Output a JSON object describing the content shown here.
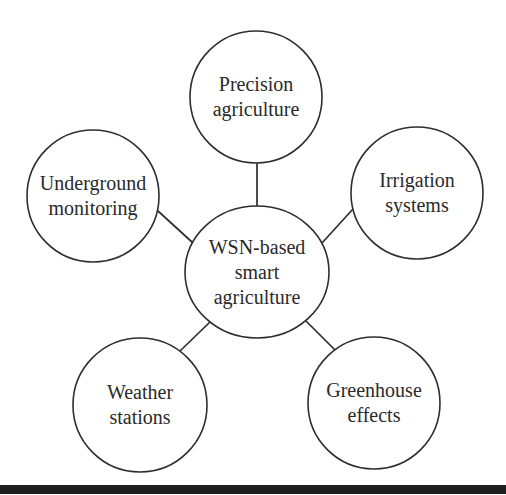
{
  "diagram": {
    "center": {
      "id": "center",
      "lines": [
        "WSN-based",
        "smart",
        "agriculture"
      ],
      "cx": 257,
      "cy": 272,
      "rx": 72,
      "ry": 66
    },
    "nodes": [
      {
        "id": "precision-agriculture",
        "lines": [
          "Precision",
          "agriculture"
        ],
        "cx": 256,
        "cy": 97,
        "r": 66
      },
      {
        "id": "underground-monitoring",
        "lines": [
          "Underground",
          "monitoring"
        ],
        "cx": 93,
        "cy": 196,
        "r": 66
      },
      {
        "id": "irrigation-systems",
        "lines": [
          "Irrigation",
          "systems"
        ],
        "cx": 417,
        "cy": 193,
        "r": 66
      },
      {
        "id": "weather-stations",
        "lines": [
          "Weather",
          "stations"
        ],
        "cx": 140,
        "cy": 405,
        "r": 67
      },
      {
        "id": "greenhouse-effects",
        "lines": [
          "Greenhouse",
          "effects"
        ],
        "cx": 374,
        "cy": 403,
        "r": 66
      }
    ],
    "edges": [
      {
        "from": "center",
        "to": "precision-agriculture",
        "x1": 257,
        "y1": 206,
        "x2": 257,
        "y2": 163
      },
      {
        "from": "center",
        "to": "underground-monitoring",
        "x1": 193,
        "y1": 243,
        "x2": 158,
        "y2": 211
      },
      {
        "from": "center",
        "to": "irrigation-systems",
        "x1": 322,
        "y1": 243,
        "x2": 353,
        "y2": 209
      },
      {
        "from": "center",
        "to": "weather-stations",
        "x1": 210,
        "y1": 322,
        "x2": 180,
        "y2": 351
      },
      {
        "from": "center",
        "to": "greenhouse-effects",
        "x1": 306,
        "y1": 321,
        "x2": 335,
        "y2": 350
      }
    ],
    "colors": {
      "stroke": "#2e2e2e",
      "text": "#2a2a2a",
      "background": "#ffffff",
      "rule": "#1e1e1e"
    }
  }
}
